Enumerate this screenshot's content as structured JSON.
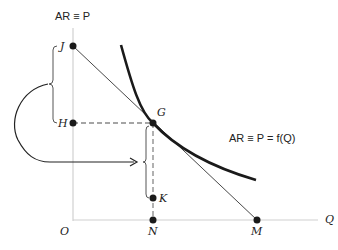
{
  "diagram": {
    "y_axis_label": "AR ≡ P",
    "x_axis_label": "Q",
    "curve_label": "AR ≡ P = f(Q)",
    "points": {
      "J": "J",
      "H": "H",
      "G": "G",
      "K": "K",
      "O": "O",
      "N": "N",
      "M": "M"
    },
    "colors": {
      "axis": "#d0d0d0",
      "curve": "#1a1a1a",
      "line": "#333333",
      "dashed": "#888888",
      "point": "#1a1a1a"
    }
  }
}
